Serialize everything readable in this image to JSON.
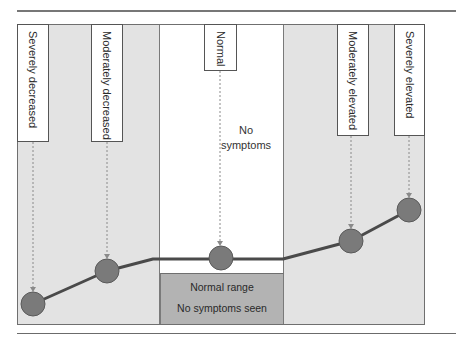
{
  "diagram": {
    "zones": [
      {
        "id": "decreased",
        "fill": "#e3e3e3"
      },
      {
        "id": "normal",
        "fill": "#ffffff"
      },
      {
        "id": "elevated",
        "fill": "#e3e3e3"
      }
    ],
    "labels": [
      {
        "text": "Severely decreased"
      },
      {
        "text": "Moderately decreased"
      },
      {
        "text": "Normal"
      },
      {
        "text": "Moderately elevated"
      },
      {
        "text": "Severely elevated"
      }
    ],
    "center_note": {
      "line1": "No",
      "line2": "symptoms"
    },
    "normal_range_box": {
      "line1": "Normal range",
      "line2": "No symptoms seen",
      "fill": "#b3b3b3"
    },
    "points": [
      {
        "label": "Severely decreased",
        "cx": 33,
        "cy": 304
      },
      {
        "label": "Moderately decreased",
        "cx": 107,
        "cy": 271
      },
      {
        "label": "Normal",
        "cx": 221,
        "cy": 258
      },
      {
        "label": "Moderately elevated",
        "cx": 351,
        "cy": 241
      },
      {
        "label": "Severely elevated",
        "cx": 409,
        "cy": 210
      }
    ],
    "colors": {
      "marker": "#7a7a7a",
      "line": "#4a4a4a",
      "arrow": "#8a8a8a"
    }
  }
}
